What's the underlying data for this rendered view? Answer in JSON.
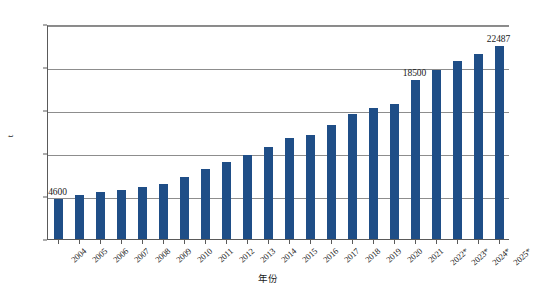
{
  "chart_data": {
    "type": "bar",
    "title": "",
    "xlabel": "年份",
    "ylabel": "t",
    "ylim": [
      0,
      25000
    ],
    "ytick_values": [
      0,
      5000,
      10000,
      15000,
      20000,
      25000
    ],
    "ytick_labels": [
      "0",
      "5000",
      "10000",
      "15000",
      "20000",
      "25000"
    ],
    "grid": true,
    "legend": "none",
    "series_color": "#1f4e87",
    "categories": [
      "2004",
      "2005",
      "2006",
      "2007",
      "2008",
      "2009",
      "2010",
      "2011",
      "2012",
      "2013",
      "2014",
      "2015",
      "2016",
      "2017",
      "2018",
      "2019",
      "2020",
      "2021",
      "2022*",
      "2023*",
      "2024*",
      "2025*"
    ],
    "values": [
      4600,
      5100,
      5450,
      5750,
      6050,
      6450,
      7250,
      8150,
      8900,
      9750,
      10750,
      11700,
      12100,
      13300,
      14550,
      15250,
      15750,
      18500,
      19700,
      20650,
      21550,
      22487
    ],
    "point_labels": [
      {
        "index": 0,
        "text": "4600"
      },
      {
        "index": 17,
        "text": "18500"
      },
      {
        "index": 21,
        "text": "22487"
      }
    ]
  }
}
